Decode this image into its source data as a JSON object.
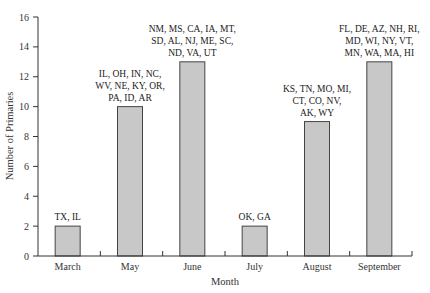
{
  "chart_data": {
    "type": "bar",
    "title": "",
    "xlabel": "Month",
    "ylabel": "Number of Primaries",
    "ylim": [
      0,
      16
    ],
    "yticks": [
      0,
      2,
      4,
      6,
      8,
      10,
      12,
      14,
      16
    ],
    "grid": false,
    "legend": null,
    "categories": [
      "March",
      "May",
      "June",
      "July",
      "August",
      "September"
    ],
    "values": [
      2,
      10,
      13,
      2,
      9,
      13
    ],
    "bar_color": "#c8c8c8",
    "annotations": [
      {
        "category": "March",
        "lines": [
          "TX, IL"
        ]
      },
      {
        "category": "May",
        "lines": [
          "IL, OH, IN, NC,",
          "WV, NE, KY, OR,",
          "PA, ID, AR"
        ]
      },
      {
        "category": "June",
        "lines": [
          "NM, MS, CA, IA, MT,",
          "SD, AL, NJ, ME, SC,",
          "ND, VA, UT"
        ]
      },
      {
        "category": "July",
        "lines": [
          "OK, GA"
        ]
      },
      {
        "category": "August",
        "lines": [
          "KS, TN, MO, MI,",
          "CT, CO, NV,",
          "AK, WY"
        ]
      },
      {
        "category": "September",
        "lines": [
          "FL, DE, AZ, NH, RI,",
          "MD, WI, NY, VT,",
          "MN, WA, MA, HI"
        ]
      }
    ]
  }
}
